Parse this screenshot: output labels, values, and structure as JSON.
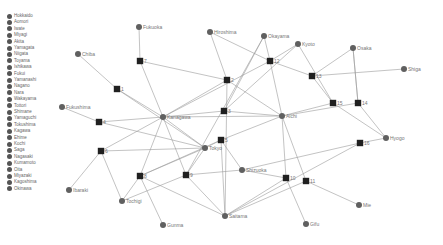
{
  "legend": {
    "items": [
      {
        "label": "Hokkaido"
      },
      {
        "label": "Aomori"
      },
      {
        "label": "Iwate"
      },
      {
        "label": "Miyagi"
      },
      {
        "label": "Akita"
      },
      {
        "label": "Yamagata"
      },
      {
        "label": "Niigata"
      },
      {
        "label": "Toyama"
      },
      {
        "label": "Ishikawa"
      },
      {
        "label": "Fukui"
      },
      {
        "label": "Yamanashi"
      },
      {
        "label": "Nagano"
      },
      {
        "label": "Nara"
      },
      {
        "label": "Wakayama"
      },
      {
        "label": "Tottori"
      },
      {
        "label": "Shimane"
      },
      {
        "label": "Yamaguchi"
      },
      {
        "label": "Tokushima"
      },
      {
        "label": "Kagawa"
      },
      {
        "label": "Ehime"
      },
      {
        "label": "Kochi"
      },
      {
        "label": "Saga"
      },
      {
        "label": "Nagasaki"
      },
      {
        "label": "Kumamoto"
      },
      {
        "label": "Oita"
      },
      {
        "label": "Miyazaki"
      },
      {
        "label": "Kagoshima"
      },
      {
        "label": "Okinawa"
      }
    ]
  },
  "graph": {
    "colors": {
      "edge": "#9a9a9a",
      "pref_node": "#606060",
      "hub_node": "#202020",
      "label": "#777777"
    },
    "pref_nodes": [
      {
        "id": "Fukuoka",
        "label": "Fukuoka",
        "x": 139,
        "y": 27
      },
      {
        "id": "Chiba",
        "label": "Chiba",
        "x": 78,
        "y": 54
      },
      {
        "id": "Hiroshima",
        "label": "Hiroshima",
        "x": 210,
        "y": 32
      },
      {
        "id": "Okayama",
        "label": "Okayama",
        "x": 264,
        "y": 36
      },
      {
        "id": "Kyoto",
        "label": "Kyoto",
        "x": 298,
        "y": 44
      },
      {
        "id": "Osaka",
        "label": "Osaka",
        "x": 353,
        "y": 48
      },
      {
        "id": "Shiga",
        "label": "Shiga",
        "x": 404,
        "y": 69
      },
      {
        "id": "Fukushima",
        "label": "Fukushima",
        "x": 62,
        "y": 107
      },
      {
        "id": "Kanagawa",
        "label": "Kanagawa",
        "x": 163,
        "y": 117
      },
      {
        "id": "Aichi",
        "label": "Aichi",
        "x": 282,
        "y": 116
      },
      {
        "id": "Tokyo",
        "label": "Tokyo",
        "x": 205,
        "y": 148
      },
      {
        "id": "Hyogo",
        "label": "Hyogo",
        "x": 386,
        "y": 138
      },
      {
        "id": "Shizuoka",
        "label": "Shizuoka",
        "x": 242,
        "y": 170
      },
      {
        "id": "Ibaraki",
        "label": "Ibaraki",
        "x": 69,
        "y": 190
      },
      {
        "id": "Tochigi",
        "label": "Tochigi",
        "x": 122,
        "y": 201
      },
      {
        "id": "Gunma",
        "label": "Gunma",
        "x": 163,
        "y": 225
      },
      {
        "id": "Saitama",
        "label": "Saitama",
        "x": 225,
        "y": 216
      },
      {
        "id": "Gifu",
        "label": "Gifu",
        "x": 306,
        "y": 224
      },
      {
        "id": "Mie",
        "label": "Mie",
        "x": 359,
        "y": 205
      }
    ],
    "hub_nodes": [
      {
        "id": "h1",
        "label": "1",
        "x": 117,
        "y": 89
      },
      {
        "id": "h2",
        "label": "2",
        "x": 227,
        "y": 80
      },
      {
        "id": "h3",
        "label": "3",
        "x": 224,
        "y": 111
      },
      {
        "id": "h4",
        "label": "4",
        "x": 99,
        "y": 122
      },
      {
        "id": "h5",
        "label": "5",
        "x": 221,
        "y": 140
      },
      {
        "id": "h6",
        "label": "6",
        "x": 101,
        "y": 151
      },
      {
        "id": "h7",
        "label": "7",
        "x": 140,
        "y": 61
      },
      {
        "id": "h8",
        "label": "8",
        "x": 140,
        "y": 176
      },
      {
        "id": "h9",
        "label": "9",
        "x": 186,
        "y": 175
      },
      {
        "id": "h10",
        "label": "10",
        "x": 286,
        "y": 178
      },
      {
        "id": "h11",
        "label": "11",
        "x": 306,
        "y": 181
      },
      {
        "id": "h12",
        "label": "12",
        "x": 270,
        "y": 61
      },
      {
        "id": "h13",
        "label": "13",
        "x": 312,
        "y": 76
      },
      {
        "id": "h14",
        "label": "14",
        "x": 358,
        "y": 103
      },
      {
        "id": "h15",
        "label": "15",
        "x": 333,
        "y": 103
      },
      {
        "id": "h16",
        "label": "16",
        "x": 360,
        "y": 143
      }
    ],
    "edges": [
      [
        "Fukuoka",
        "h7"
      ],
      [
        "h7",
        "Kanagawa"
      ],
      [
        "h7",
        "h2"
      ],
      [
        "Chiba",
        "h1"
      ],
      [
        "h1",
        "Kanagawa"
      ],
      [
        "h1",
        "Tokyo"
      ],
      [
        "Hiroshima",
        "h2"
      ],
      [
        "Hiroshima",
        "h12"
      ],
      [
        "h2",
        "Kanagawa"
      ],
      [
        "h2",
        "Saitama"
      ],
      [
        "h2",
        "Aichi"
      ],
      [
        "Okayama",
        "h12"
      ],
      [
        "Okayama",
        "h3"
      ],
      [
        "Okayama",
        "h9"
      ],
      [
        "h12",
        "Aichi"
      ],
      [
        "h12",
        "h13"
      ],
      [
        "h12",
        "Kanagawa"
      ],
      [
        "Kyoto",
        "h3"
      ],
      [
        "Kyoto",
        "h15"
      ],
      [
        "Kyoto",
        "h12"
      ],
      [
        "Osaka",
        "h13"
      ],
      [
        "Osaka",
        "h14"
      ],
      [
        "h13",
        "Shiga"
      ],
      [
        "h13",
        "h15"
      ],
      [
        "h3",
        "Kanagawa"
      ],
      [
        "h3",
        "Aichi"
      ],
      [
        "Fukushima",
        "h4"
      ],
      [
        "h4",
        "Kanagawa"
      ],
      [
        "h4",
        "Tokyo"
      ],
      [
        "Kanagawa",
        "h6"
      ],
      [
        "Kanagawa",
        "h8"
      ],
      [
        "Kanagawa",
        "h9"
      ],
      [
        "Kanagawa",
        "Tokyo"
      ],
      [
        "Kanagawa",
        "Aichi"
      ],
      [
        "h6",
        "Tokyo"
      ],
      [
        "h6",
        "Ibaraki"
      ],
      [
        "h6",
        "Tochigi"
      ],
      [
        "Aichi",
        "h5"
      ],
      [
        "Aichi",
        "h10"
      ],
      [
        "Aichi",
        "h11"
      ],
      [
        "Aichi",
        "h15"
      ],
      [
        "Aichi",
        "h14"
      ],
      [
        "h15",
        "Hyogo"
      ],
      [
        "h14",
        "Hyogo"
      ],
      [
        "h16",
        "Hyogo"
      ],
      [
        "h16",
        "Saitama"
      ],
      [
        "h5",
        "Tokyo"
      ],
      [
        "h5",
        "Saitama"
      ],
      [
        "h5",
        "Shizuoka"
      ],
      [
        "h5",
        "h8"
      ],
      [
        "Tokyo",
        "h8"
      ],
      [
        "Tokyo",
        "h9"
      ],
      [
        "h8",
        "Tochigi"
      ],
      [
        "h8",
        "Gunma"
      ],
      [
        "h8",
        "Saitama"
      ],
      [
        "h9",
        "Tochigi"
      ],
      [
        "h9",
        "Shizuoka"
      ],
      [
        "h9",
        "Saitama"
      ],
      [
        "Shizuoka",
        "h10"
      ],
      [
        "Shizuoka",
        "h16"
      ],
      [
        "h10",
        "Gifu"
      ],
      [
        "h10",
        "Saitama"
      ],
      [
        "h11",
        "Saitama"
      ],
      [
        "h11",
        "Mie"
      ],
      [
        "h14",
        "Osaka"
      ]
    ]
  }
}
